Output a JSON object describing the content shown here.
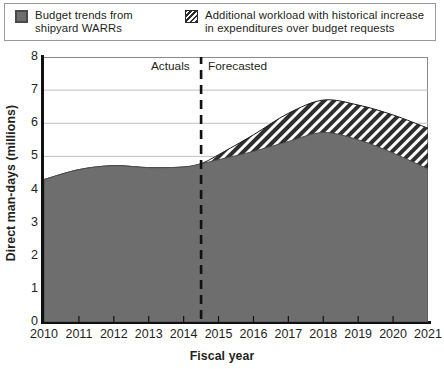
{
  "legend": {
    "items": [
      {
        "swatch": "solid-gray-square",
        "line1": "Budget trends from",
        "line2": "shipyard WARRs"
      },
      {
        "swatch": "diagonal-hatch-square",
        "line1": "Additional workload with historical increase",
        "line2": "in expenditures over budget requests"
      }
    ]
  },
  "annotations": {
    "actuals": "Actuals",
    "forecasted": "Forecasted",
    "divider_x": 2014.5
  },
  "colors": {
    "series_budget_fill": "#6e6e6e",
    "series_additional_fill": "#2e2e2e",
    "series_additional_stripe": "#ffffff",
    "axis": "#111111",
    "grid": "#b9b9b9",
    "text": "#231f20"
  },
  "chart_data": {
    "type": "area",
    "title": "",
    "subtitle": "",
    "xlabel": "Fiscal year",
    "ylabel": "Direct man-days (millions)",
    "xlim": [
      2010,
      2021
    ],
    "ylim": [
      0,
      8
    ],
    "ytick_labels": [
      "0",
      "1",
      "2",
      "3",
      "4",
      "5",
      "6",
      "7",
      "8"
    ],
    "yticks": [
      0,
      1,
      2,
      3,
      4,
      5,
      6,
      7,
      8
    ],
    "xtick_labels": [
      "2010",
      "2011",
      "2012",
      "2013",
      "2014",
      "2015",
      "2016",
      "2017",
      "2018",
      "2019",
      "2020",
      "2021"
    ],
    "xticks": [
      2010,
      2011,
      2012,
      2013,
      2014,
      2015,
      2016,
      2017,
      2018,
      2019,
      2020,
      2021
    ],
    "grid": "horizontal",
    "legend_position": "top",
    "stacked": true,
    "x": [
      2010,
      2011,
      2012,
      2013,
      2014,
      2014.5,
      2015,
      2016,
      2017,
      2018,
      2019,
      2020,
      2021
    ],
    "series": [
      {
        "name": "Budget trends from shipyard WARRs",
        "fill": "#6e6e6e",
        "values": [
          4.3,
          4.6,
          4.72,
          4.66,
          4.68,
          4.78,
          4.9,
          5.15,
          5.45,
          5.72,
          5.5,
          5.1,
          4.62
        ]
      },
      {
        "name": "Additional workload with historical increase in expenditures over budget requests",
        "fill": "hatch",
        "cumulative_top": [
          4.3,
          4.6,
          4.72,
          4.66,
          4.68,
          4.78,
          5.05,
          5.65,
          6.3,
          6.7,
          6.55,
          6.25,
          5.85
        ]
      }
    ]
  }
}
